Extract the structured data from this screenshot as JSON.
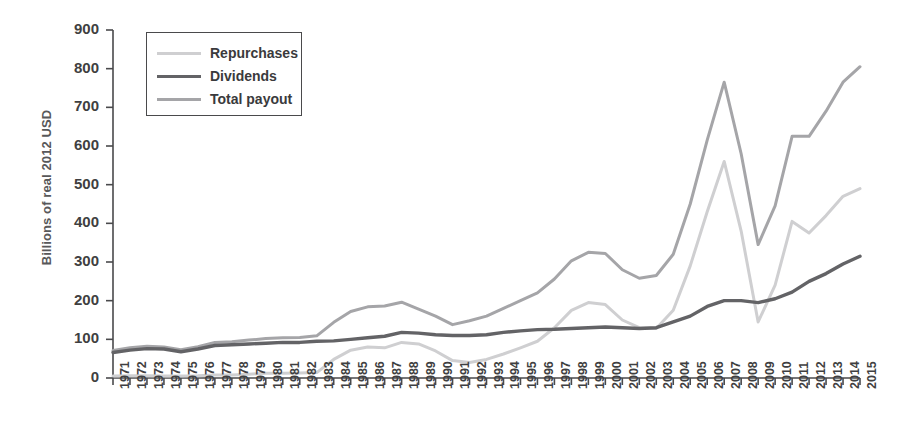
{
  "chart_data": {
    "type": "line",
    "title": "",
    "subtitle": "",
    "xlabel": "",
    "ylabel": "Billions of real 2012 USD",
    "xlim": [
      1971,
      2015
    ],
    "ylim": [
      0,
      900
    ],
    "ytick_step": 100,
    "yticks": [
      0,
      100,
      200,
      300,
      400,
      500,
      600,
      700,
      800,
      900
    ],
    "grid": false,
    "legend_position": "top-left",
    "x": [
      1971,
      1972,
      1973,
      1974,
      1975,
      1976,
      1977,
      1978,
      1979,
      1980,
      1981,
      1982,
      1983,
      1984,
      1985,
      1986,
      1987,
      1988,
      1989,
      1990,
      1991,
      1992,
      1993,
      1994,
      1995,
      1996,
      1997,
      1998,
      1999,
      2000,
      2001,
      2002,
      2003,
      2004,
      2005,
      2006,
      2007,
      2008,
      2009,
      2010,
      2011,
      2012,
      2013,
      2014,
      2015
    ],
    "categories": [
      "1971",
      "1972",
      "1973",
      "1974",
      "1975",
      "1976",
      "1977",
      "1978",
      "1979",
      "1980",
      "1981",
      "1982",
      "1983",
      "1984",
      "1985",
      "1986",
      "1987",
      "1988",
      "1989",
      "1990",
      "1991",
      "1992",
      "1993",
      "1994",
      "1995",
      "1996",
      "1997",
      "1998",
      "1999",
      "2000",
      "2001",
      "2002",
      "2003",
      "2004",
      "2005",
      "2006",
      "2007",
      "2008",
      "2009",
      "2010",
      "2011",
      "2012",
      "2013",
      "2014",
      "2015"
    ],
    "series": [
      {
        "name": "Repurchases",
        "color": "#cfcfd1",
        "line_width": 3.0,
        "values": [
          5,
          6,
          6,
          5,
          5,
          6,
          8,
          8,
          10,
          12,
          12,
          13,
          14,
          48,
          72,
          80,
          78,
          92,
          88,
          70,
          45,
          40,
          48,
          62,
          78,
          95,
          130,
          175,
          195,
          190,
          150,
          130,
          128,
          175,
          290,
          430,
          560,
          380,
          145,
          240,
          405,
          375,
          420,
          470,
          490
        ]
      },
      {
        "name": "Dividends",
        "color": "#636366",
        "line_width": 3.4,
        "values": [
          66,
          72,
          76,
          75,
          68,
          75,
          84,
          86,
          88,
          90,
          92,
          92,
          95,
          96,
          100,
          104,
          108,
          118,
          116,
          112,
          110,
          110,
          112,
          118,
          122,
          125,
          126,
          128,
          130,
          132,
          130,
          128,
          130,
          145,
          160,
          185,
          200,
          200,
          195,
          205,
          222,
          250,
          270,
          295,
          315
        ]
      },
      {
        "name": "Total payout",
        "color": "#a5a5a8",
        "line_width": 3.0,
        "values": [
          71,
          78,
          82,
          80,
          73,
          81,
          92,
          94,
          98,
          102,
          104,
          105,
          109,
          144,
          172,
          184,
          186,
          196,
          178,
          160,
          138,
          148,
          160,
          180,
          200,
          220,
          256,
          303,
          325,
          322,
          280,
          258,
          265,
          320,
          450,
          615,
          765,
          580,
          345,
          445,
          625,
          625,
          690,
          765,
          805
        ]
      }
    ]
  }
}
